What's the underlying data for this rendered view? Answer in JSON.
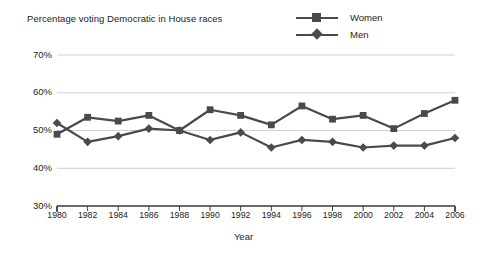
{
  "chart_data": {
    "type": "line",
    "title": "Percentage voting Democratic in House races",
    "xlabel": "Year",
    "ylabel": "",
    "grid": true,
    "legend_position": "top-right",
    "categories": [
      1980,
      1982,
      1984,
      1986,
      1988,
      1990,
      1992,
      1994,
      1996,
      1998,
      2000,
      2002,
      2004,
      2006
    ],
    "x": [
      "1980",
      "1982",
      "1984",
      "1986",
      "1988",
      "1990",
      "1992",
      "1994",
      "1996",
      "1998",
      "2000",
      "2002",
      "2004",
      "2006"
    ],
    "xlim": [
      1980,
      2006
    ],
    "ylim": [
      30,
      70
    ],
    "yticks": [
      30,
      40,
      50,
      60,
      70
    ],
    "ytick_labels": [
      "30%",
      "40%",
      "50%",
      "60%",
      "70%"
    ],
    "series": [
      {
        "name": "Women",
        "marker": "square",
        "color": "#4a4a4a",
        "values": [
          49.0,
          53.5,
          52.5,
          54.0,
          50.0,
          55.5,
          54.0,
          51.5,
          56.5,
          53.0,
          54.0,
          50.5,
          54.5,
          58.0
        ]
      },
      {
        "name": "Men",
        "marker": "diamond",
        "color": "#4a4a4a",
        "values": [
          52.0,
          47.0,
          48.5,
          50.5,
          50.0,
          47.5,
          49.5,
          45.5,
          47.5,
          47.0,
          45.5,
          46.0,
          46.0,
          48.0
        ]
      }
    ]
  },
  "colors": {
    "series_line": "#4a4a4a",
    "gridline": "#d0d0d0",
    "axis": "#3a3a3a",
    "text": "#232323",
    "background": "#ffffff"
  }
}
